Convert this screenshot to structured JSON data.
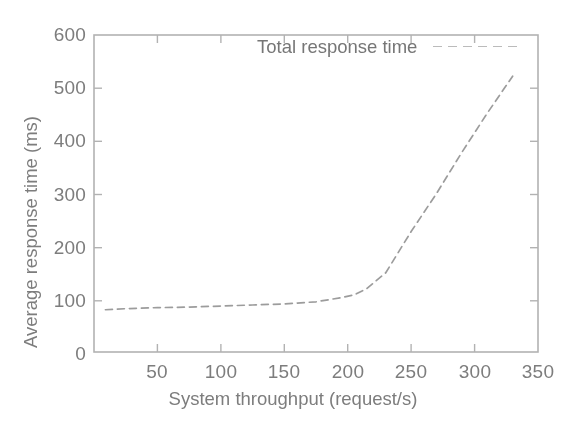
{
  "chart_data": {
    "type": "line",
    "title": "",
    "xlabel": "System throughput (request/s)",
    "ylabel": "Average response time (ms)",
    "xlim": [
      0,
      350
    ],
    "ylim": [
      0,
      600
    ],
    "xticks": [
      50,
      100,
      150,
      200,
      250,
      300,
      350
    ],
    "yticks": [
      0,
      100,
      200,
      300,
      400,
      500,
      600
    ],
    "xtick_labels": [
      "50",
      "100",
      "150",
      "200",
      "250",
      "300",
      "350"
    ],
    "ytick_labels": [
      "0",
      "100",
      "200",
      "300",
      "400",
      "500",
      "600"
    ],
    "grid": false,
    "legend_position": "top-center",
    "series": [
      {
        "name": "Total response time",
        "line_style": "dashed",
        "color": "#9a9a9a",
        "x": [
          9,
          25,
          50,
          75,
          100,
          125,
          150,
          175,
          195,
          205,
          215,
          230,
          250,
          270,
          290,
          310,
          330
        ],
        "y": [
          80,
          82,
          84,
          85,
          87,
          89,
          91,
          95,
          103,
          108,
          120,
          150,
          228,
          300,
          378,
          452,
          522
        ]
      }
    ]
  },
  "legend": {
    "entries": [
      {
        "label": "Total response time",
        "swatch": "dashed-line-swatch"
      }
    ]
  },
  "axes": {
    "y_title": "Average response time (ms)",
    "x_title": "System throughput (request/s)"
  },
  "figure": {
    "background_color": "#fefefe",
    "axis_color": "#a8a8a8",
    "text_color": "#7a7a7a",
    "series_color": "#9a9a9a"
  }
}
